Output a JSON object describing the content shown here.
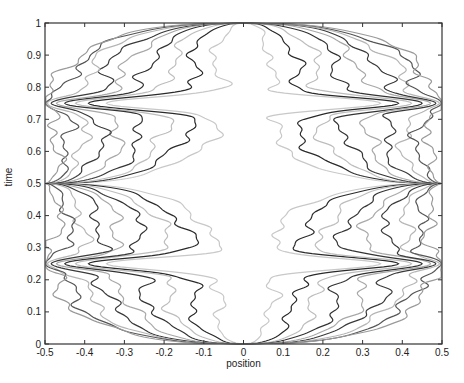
{
  "chart_data": {
    "type": "line",
    "title": "",
    "xlabel": "position",
    "ylabel": "time",
    "xlim": [
      -0.5,
      0.5
    ],
    "ylim": [
      0,
      1
    ],
    "grid": false,
    "legend": null,
    "x_ticks": [
      -0.5,
      -0.4,
      -0.3,
      -0.2,
      -0.1,
      0,
      0.1,
      0.2,
      0.3,
      0.4,
      0.5
    ],
    "x_tick_labels": [
      "-0.5",
      "-0.4",
      "-0.3",
      "-0.2",
      "-0.1",
      "0",
      "0.1",
      "0.2",
      "0.3",
      "0.4",
      "0.5"
    ],
    "y_ticks": [
      0,
      0.1,
      0.2,
      0.3,
      0.4,
      0.5,
      0.6,
      0.7,
      0.8,
      0.9,
      1
    ],
    "y_tick_labels": [
      "0",
      "0.1",
      "0.2",
      "0.3",
      "0.4",
      "0.5",
      "0.6",
      "0.7",
      "0.8",
      "0.9",
      "1"
    ],
    "convergence_points": [
      {
        "x": 0,
        "y": 0
      },
      {
        "x": 0,
        "y": 1
      },
      {
        "x": -0.5,
        "y": 0.5
      },
      {
        "x": 0.5,
        "y": 0.5
      }
    ],
    "edge_pinch_points": [
      {
        "x": -0.5,
        "y": 0.25
      },
      {
        "x": 0.5,
        "y": 0.25
      },
      {
        "x": -0.5,
        "y": 0.75
      },
      {
        "x": 0.5,
        "y": 0.75
      }
    ],
    "series": [
      {
        "name": "level-1",
        "color": "#c8c8c8",
        "offset": 0.06
      },
      {
        "name": "level-2",
        "color": "#2a2a2a",
        "offset": 0.13
      },
      {
        "name": "level-3",
        "color": "#bdbdbd",
        "offset": 0.19
      },
      {
        "name": "level-4",
        "color": "#333333",
        "offset": 0.25
      },
      {
        "name": "level-5",
        "color": "#a8a8a8",
        "offset": 0.31
      },
      {
        "name": "level-6",
        "color": "#3a3a3a",
        "offset": 0.36
      },
      {
        "name": "level-7",
        "color": "#b5b5b5",
        "offset": 0.41
      },
      {
        "name": "level-8",
        "color": "#555555",
        "offset": 0.45
      },
      {
        "name": "level-9",
        "color": "#9a9a9a",
        "offset": 0.48
      }
    ],
    "plot_box_px": {
      "left": 45,
      "top": 23,
      "right": 442,
      "bottom": 344
    }
  }
}
